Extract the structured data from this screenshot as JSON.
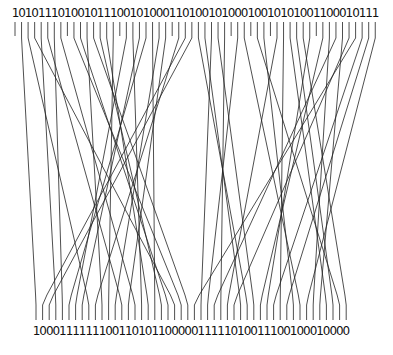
{
  "diagram": {
    "type": "bit-permutation-wiring",
    "top_bits": "10101110100101110010100011010010100010010101001100010111",
    "bottom_bits": "100011111110011010110000011111010011100100010000",
    "top_start_x": 15,
    "top_pitch": 6.55,
    "bottom_start_x": 36,
    "bottom_pitch": 6.6,
    "top_tick_y": [
      22,
      38
    ],
    "bottom_tick_y": [
      305,
      320
    ],
    "line_color": "#222222",
    "text_color": "#111111"
  }
}
